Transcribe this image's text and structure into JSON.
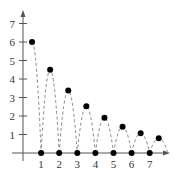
{
  "chart_data": {
    "type": "scatter",
    "title": "",
    "xlabel": "",
    "ylabel": "",
    "xlim": [
      0,
      8
    ],
    "ylim": [
      0,
      7.5
    ],
    "grid": false,
    "legend": null,
    "x_ticks": [
      "1",
      "2",
      "3",
      "4",
      "5",
      "6",
      "7"
    ],
    "y_ticks": [
      "1",
      "2",
      "3",
      "4",
      "5",
      "6",
      "7"
    ],
    "series": [
      {
        "name": "peaks",
        "marker": "filled-circle",
        "points": [
          {
            "x": 0.5,
            "y": 6
          },
          {
            "x": 1.5,
            "y": 4.5
          },
          {
            "x": 2.5,
            "y": 3.375
          },
          {
            "x": 3.5,
            "y": 2.53
          },
          {
            "x": 4.5,
            "y": 1.9
          },
          {
            "x": 5.5,
            "y": 1.42
          },
          {
            "x": 6.5,
            "y": 1.07
          },
          {
            "x": 7.5,
            "y": 0.8
          }
        ]
      },
      {
        "name": "zeros",
        "marker": "filled-circle",
        "points": [
          {
            "x": 1,
            "y": 0
          },
          {
            "x": 2,
            "y": 0
          },
          {
            "x": 3,
            "y": 0
          },
          {
            "x": 4,
            "y": 0
          },
          {
            "x": 5,
            "y": 0
          },
          {
            "x": 6,
            "y": 0
          },
          {
            "x": 7,
            "y": 0
          }
        ]
      },
      {
        "name": "bounce-curve",
        "style": "dashed",
        "description": "dashed parabolic arcs connecting each peak to adjacent integer zeros"
      }
    ],
    "colors": {
      "axis": "#555555",
      "marker": "#000000",
      "dashed_curve": "#888888"
    }
  }
}
